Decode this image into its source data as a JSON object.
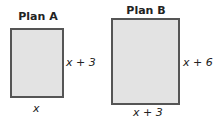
{
  "plans": [
    {
      "title": "Plan A",
      "side_label": "x + 3",
      "bottom_label": "x",
      "fill": "#e3e3e3",
      "border": "#555555"
    },
    {
      "title": "Plan B",
      "side_label": "x + 6",
      "bottom_label": "x + 3",
      "fill": "#e3e3e3",
      "border": "#555555"
    }
  ]
}
